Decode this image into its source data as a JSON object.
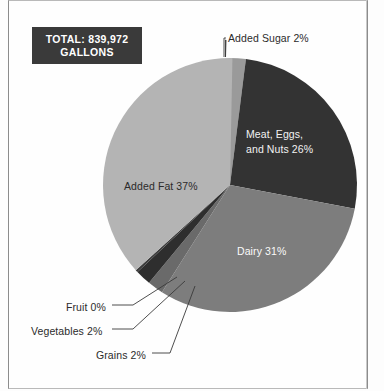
{
  "badge": {
    "line1": "TOTAL: 839,972",
    "line2": "GALLONS"
  },
  "labels": {
    "added_sugar": "Added Sugar 2%",
    "meat_line1": "Meat, Eggs,",
    "meat_line2": "and Nuts 26%",
    "dairy": "Dairy 31%",
    "added_fat": "Added Fat 37%",
    "fruit": "Fruit 0%",
    "vegetables": "Vegetables 2%",
    "grains": "Grains 2%"
  },
  "chart_data": {
    "type": "pie",
    "title": "",
    "subtitle": "",
    "total_label": "TOTAL: 839,972 GALLONS",
    "total_value": 839972,
    "unit": "gallons",
    "value_suffix": "%",
    "legend_position": "none",
    "labels_inline": true,
    "grid": false,
    "categories": [
      "Added Sugar",
      "Meat, Eggs, and Nuts",
      "Dairy",
      "Grains",
      "Vegetables",
      "Fruit",
      "Added Fat"
    ],
    "values": [
      2,
      26,
      31,
      2,
      2,
      0,
      37
    ],
    "colors": [
      "#9a9a9a",
      "#333333",
      "#7d7d7d",
      "#6a6a6a",
      "#2e2e2e",
      "#3c3c3c",
      "#b4b4b4"
    ],
    "annotations": [
      "Added Sugar 2%",
      "Meat, Eggs, and Nuts 26%",
      "Dairy 31%",
      "Grains 2%",
      "Vegetables 2%",
      "Fruit 0%",
      "Added Fat 37%"
    ],
    "start_angle_deg": 0,
    "direction": "clockwise",
    "center": [
      230,
      185
    ],
    "radius": 127
  },
  "theme": {
    "page_bg": "#fdfdfd",
    "badge_bg": "#3a3a3a",
    "badge_text": "#ffffff",
    "text": "#2b2b2b",
    "leader_line": "#3a3a3a"
  }
}
